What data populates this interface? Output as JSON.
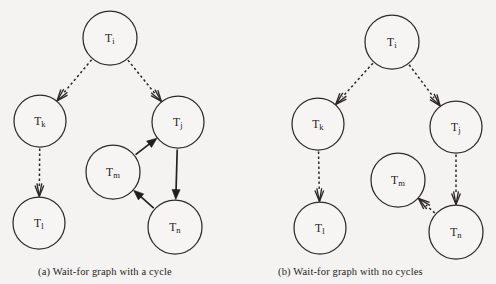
{
  "figure": {
    "background_color": "#f4f3f1",
    "ink_color": "#232120",
    "width": 496,
    "height": 284
  },
  "panels": [
    {
      "id": "a",
      "caption": "(a) Wait-for graph with a cycle",
      "nodes": [
        {
          "id": "Ti",
          "base": "T",
          "sub": "i",
          "cx": 110,
          "cy": 38,
          "r": 27
        },
        {
          "id": "Tk",
          "base": "T",
          "sub": "k",
          "cx": 40,
          "cy": 121,
          "r": 26
        },
        {
          "id": "Tj",
          "base": "T",
          "sub": "j",
          "cx": 178,
          "cy": 122,
          "r": 26
        },
        {
          "id": "Tm",
          "base": "T",
          "sub": "m",
          "cx": 113,
          "cy": 172,
          "r": 27
        },
        {
          "id": "Tl",
          "base": "T",
          "sub": "l",
          "cx": 39,
          "cy": 223,
          "r": 26
        },
        {
          "id": "Tn",
          "base": "T",
          "sub": "n",
          "cx": 175,
          "cy": 227,
          "r": 27
        }
      ],
      "edges": [
        {
          "from": "Ti",
          "to": "Tk",
          "style": "dashed",
          "head": "open"
        },
        {
          "from": "Ti",
          "to": "Tj",
          "style": "dashed",
          "head": "open"
        },
        {
          "from": "Tk",
          "to": "Tl",
          "style": "dashed",
          "head": "open"
        },
        {
          "from": "Tm",
          "to": "Tj",
          "style": "solid",
          "head": "filled"
        },
        {
          "from": "Tj",
          "to": "Tn",
          "style": "solid",
          "head": "filled"
        },
        {
          "from": "Tn",
          "to": "Tm",
          "style": "solid",
          "head": "filled"
        }
      ],
      "has_cycle": true,
      "cycle": [
        "Tm",
        "Tj",
        "Tn",
        "Tm"
      ]
    },
    {
      "id": "b",
      "caption": "(b) Wait-for graph with no cycles",
      "nodes": [
        {
          "id": "Ti",
          "base": "T",
          "sub": "i",
          "cx": 392,
          "cy": 42,
          "r": 27
        },
        {
          "id": "Tk",
          "base": "T",
          "sub": "k",
          "cx": 318,
          "cy": 124,
          "r": 26
        },
        {
          "id": "Tj",
          "base": "T",
          "sub": "j",
          "cx": 456,
          "cy": 127,
          "r": 26
        },
        {
          "id": "Tm",
          "base": "T",
          "sub": "m",
          "cx": 398,
          "cy": 180,
          "r": 27
        },
        {
          "id": "Tl",
          "base": "T",
          "sub": "l",
          "cx": 320,
          "cy": 228,
          "r": 26
        },
        {
          "id": "Tn",
          "base": "T",
          "sub": "n",
          "cx": 456,
          "cy": 232,
          "r": 27
        }
      ],
      "edges": [
        {
          "from": "Ti",
          "to": "Tk",
          "style": "dashed",
          "head": "open"
        },
        {
          "from": "Ti",
          "to": "Tj",
          "style": "dashed",
          "head": "open"
        },
        {
          "from": "Tk",
          "to": "Tl",
          "style": "dashed",
          "head": "open"
        },
        {
          "from": "Tj",
          "to": "Tn",
          "style": "dashed",
          "head": "open"
        },
        {
          "from": "Tn",
          "to": "Tm",
          "style": "dashed",
          "head": "open"
        }
      ],
      "has_cycle": false,
      "cycle": []
    }
  ]
}
